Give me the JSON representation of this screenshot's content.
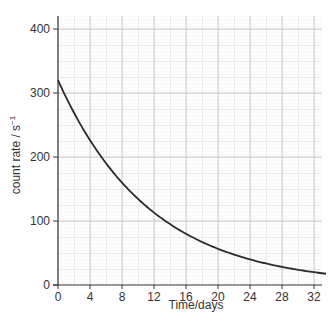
{
  "chart_data": {
    "type": "line",
    "title": "",
    "xlabel": "Time / days",
    "ylabel": "count rate / s⁻¹",
    "xlim": [
      0,
      33.5
    ],
    "ylim": [
      0,
      420
    ],
    "x_ticks": [
      0,
      4,
      8,
      12,
      16,
      20,
      24,
      28,
      32
    ],
    "y_ticks": [
      0,
      100,
      200,
      300,
      400
    ],
    "grid": true,
    "legend": null,
    "series": [
      {
        "name": "count rate",
        "description": "exponential decay, half-life 8 days",
        "x": [
          0,
          2,
          4,
          6,
          8,
          10,
          12,
          14,
          16,
          18,
          20,
          22,
          24,
          26,
          28,
          30,
          32,
          33.5
        ],
        "values": [
          320,
          269,
          226,
          190,
          160,
          135,
          113,
          95,
          80,
          67,
          57,
          48,
          40,
          34,
          28,
          24,
          20,
          17
        ]
      }
    ],
    "colors": {
      "curve": "#2b2b2b",
      "axis": "#333333",
      "grid_minor": "#e6e6e6",
      "grid_major": "#cfcfcf"
    }
  },
  "axes": {
    "x_title": "Time/days",
    "y_title_main": "count rate / s",
    "y_title_sup": "−1"
  }
}
